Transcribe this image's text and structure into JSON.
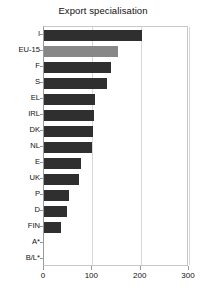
{
  "chart_data": {
    "type": "bar",
    "orientation": "horizontal",
    "title": "Export specialisation",
    "xlabel": "",
    "ylabel": "",
    "xlim": [
      0,
      300
    ],
    "xticks": [
      0,
      100,
      200,
      300
    ],
    "grid": true,
    "legend": "none",
    "highlight_category": "EU-15",
    "colors": {
      "bar": "#2f2f2f",
      "bar_highlight": "#878787",
      "frame": "#c8c8c8",
      "grid": "#d8d8d8",
      "text": "#111111"
    },
    "categories": [
      "I",
      "EU-15",
      "F",
      "S",
      "EL",
      "IRL",
      "DK",
      "NL",
      "E",
      "UK",
      "P",
      "D",
      "FIN",
      "A*",
      "B/L*"
    ],
    "values": [
      203,
      153,
      139,
      130,
      106,
      103,
      101,
      99,
      77,
      72,
      52,
      48,
      35,
      0,
      0
    ]
  }
}
